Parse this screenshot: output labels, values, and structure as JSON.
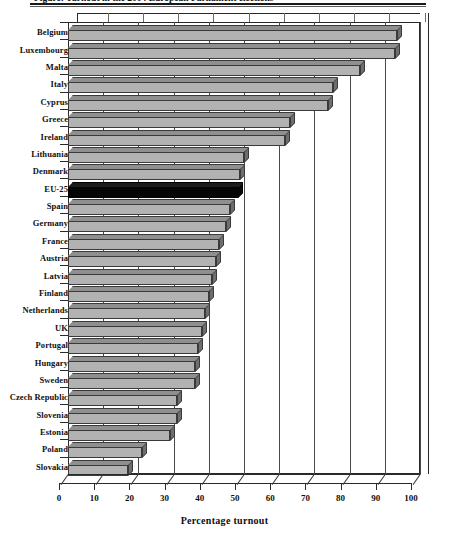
{
  "figure": {
    "title": "Figure: Turnout in the 2004 European Parliament elections",
    "x_axis_title": "Percentage turnout"
  },
  "chart_data": {
    "type": "bar",
    "orientation": "horizontal",
    "title": "Figure: Turnout in the 2004 European Parliament elections",
    "xlabel": "Percentage turnout",
    "ylabel": "",
    "xlim": [
      0,
      100
    ],
    "xticks": [
      0,
      10,
      20,
      30,
      40,
      50,
      60,
      70,
      80,
      90,
      100
    ],
    "grid": true,
    "legend": "none",
    "highlight_category": "EU-25",
    "highlight_color": "#050505",
    "bar_color": "#b2b2b2",
    "categories": [
      "Belgium",
      "Luxembourg",
      "Malta",
      "Italy",
      "Cyprus",
      "Greece",
      "Ireland",
      "Lithuania",
      "Denmark",
      "EU-25",
      "Spain",
      "Germany",
      "France",
      "Austria",
      "Latvia",
      "Finland",
      "Netherlands",
      "UK",
      "Portugal",
      "Hungary",
      "Sweden",
      "Czech Republic",
      "Slovenia",
      "Estonia",
      "Poland",
      "Slovakia"
    ],
    "values": [
      93.5,
      93.0,
      83.0,
      75.3,
      73.8,
      63.0,
      61.6,
      50.0,
      49.0,
      48.3,
      46.0,
      45.0,
      43.0,
      42.0,
      41.0,
      40.0,
      39.0,
      38.0,
      37.0,
      36.0,
      36.0,
      31.0,
      31.0,
      29.0,
      21.0,
      17.0
    ]
  }
}
